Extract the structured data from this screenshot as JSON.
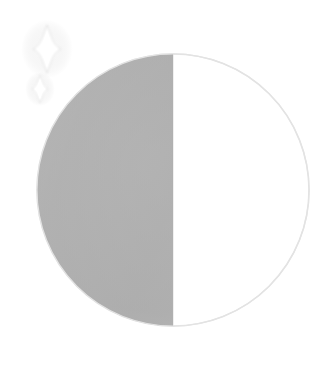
{
  "illustration": {
    "name": "half-moon-with-sparkles",
    "alt_text": "Half moon icon with two sparkles",
    "background_color": "#ffffff",
    "canvas": {
      "width": 332,
      "height": 369
    }
  },
  "moon": {
    "name": "half-moon-disc",
    "phase_label": "Half Moon",
    "center_x": 173,
    "center_y": 190,
    "radius": 142,
    "shadow_half": "left",
    "lit_half": "right",
    "shadow_color": "#b0b0b0",
    "shadow_color_dark": "#a6a6a6",
    "shadow_color_light": "#bcbcbc",
    "lit_color": "#ffffff",
    "outline_color": "#e3e3e3",
    "terminator_x": 173,
    "terminator_color": "#b0b0b0"
  },
  "sparkles": [
    {
      "name": "sparkle-large",
      "center_x": 47,
      "center_y": 49,
      "half_height": 24,
      "half_width": 14,
      "color": "#ffffff",
      "glow_color": "#d8d8d8"
    },
    {
      "name": "sparkle-small",
      "center_x": 40,
      "center_y": 89,
      "half_height": 14,
      "half_width": 8,
      "color": "#ffffff",
      "glow_color": "#d8d8d8"
    }
  ]
}
